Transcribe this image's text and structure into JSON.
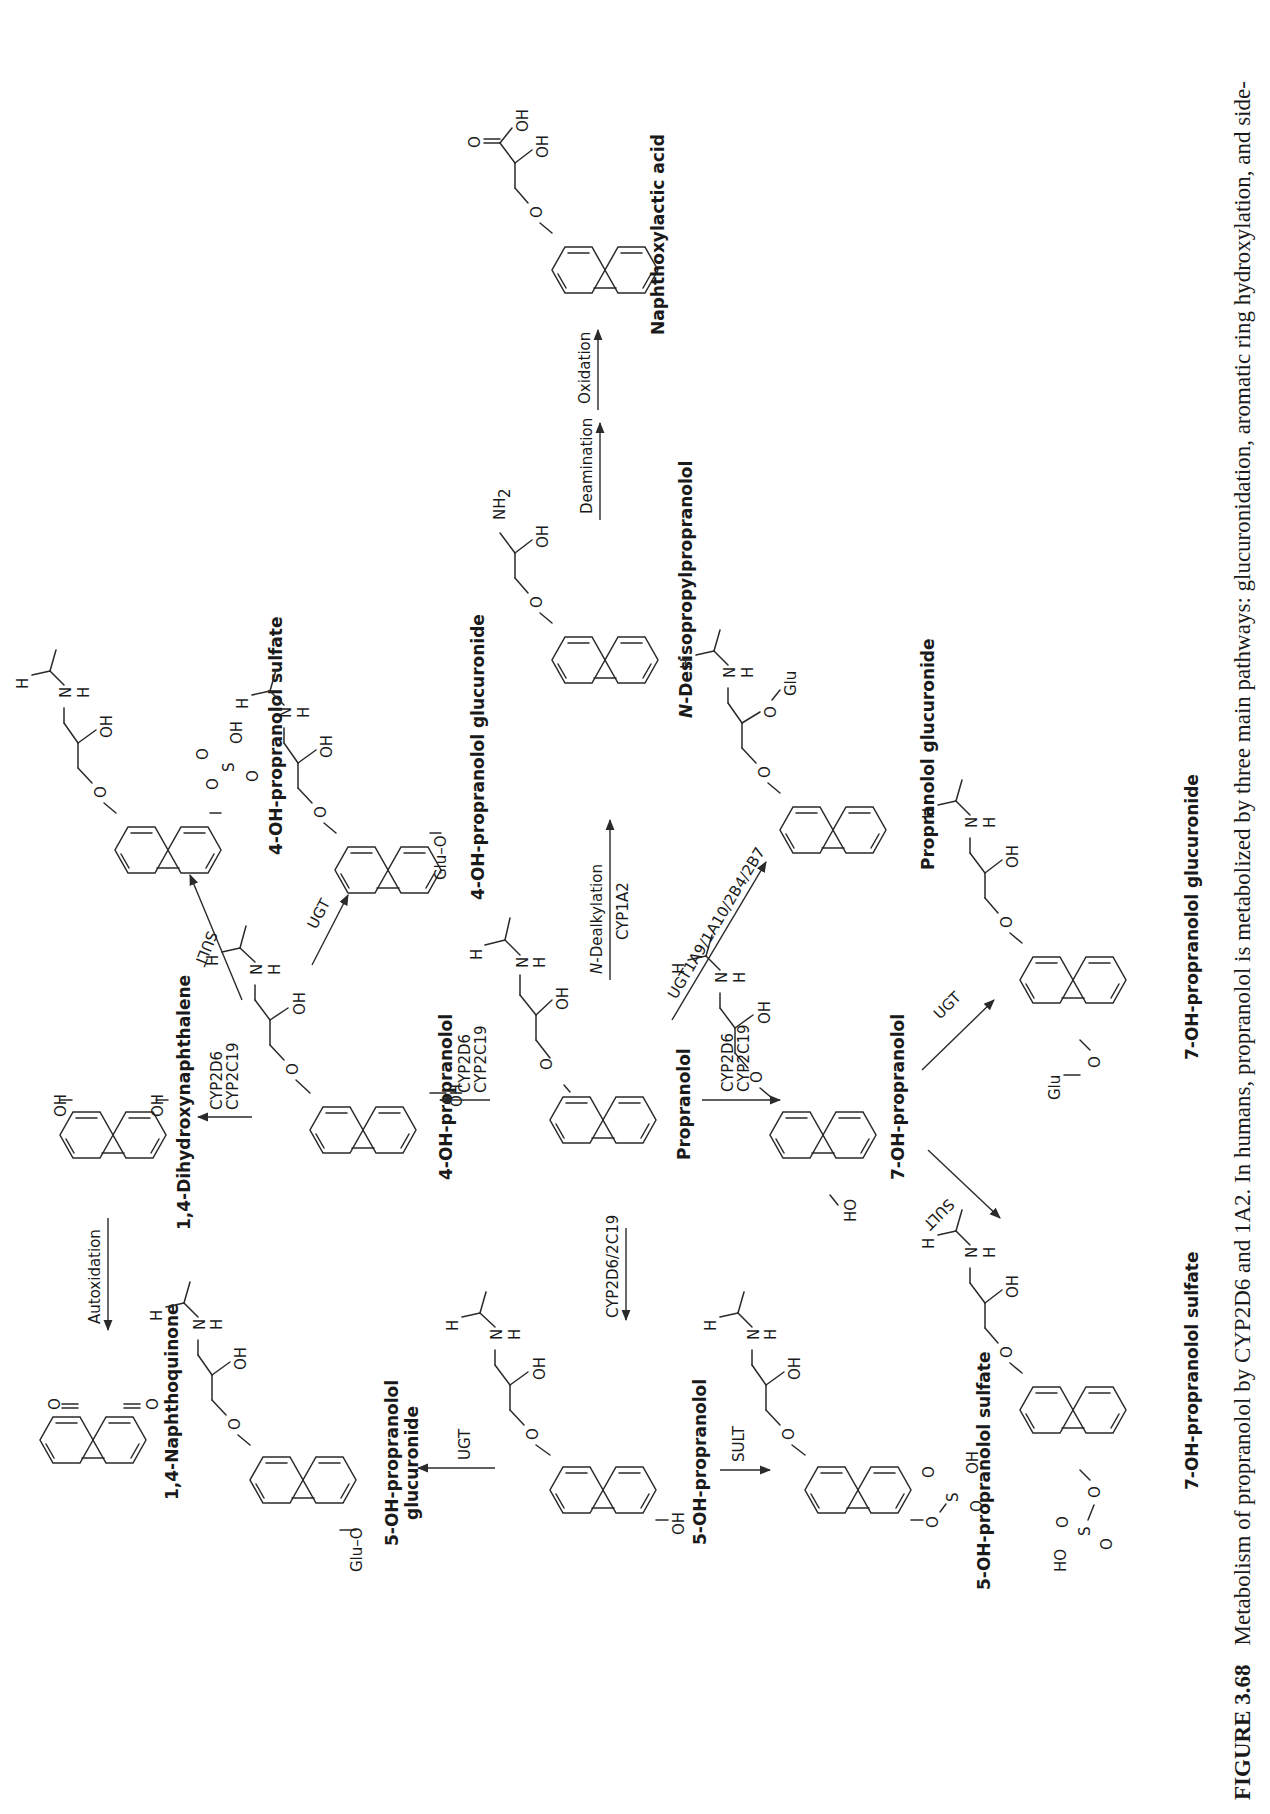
{
  "figure": {
    "number_label": "FIGURE 3.68",
    "caption": "Metabolism of propranolol by CYP2D6 and 1A2. In humans, propranolol is metabolized by three main pathways: glucuronidation, aromatic ring hydroxylation, and side-",
    "orientation": "rotated 90° counter-clockwise (landscape page)"
  },
  "compounds": {
    "propranolol": "Propranolol",
    "oh4": "4-OH-propranolol",
    "dihydroxy": "1,4-Dihydroxynaphthalene",
    "naphthoquinone": "1,4-Naphthoquinone",
    "oh5": "5-OH-propranolol",
    "oh5_gluc_line1": "5-OH-propranolol",
    "oh5_gluc_line2": "glucuronide",
    "oh5_sulf": "5-OH-propranolol sulfate",
    "oh7": "7-OH-propranolol",
    "oh7_sulf": "7-OH-propranolol sulfate",
    "oh7_gluc": "7-OH-propranolol glucuronide",
    "oh4_sulf": "4-OH-propranolol sulfate",
    "oh4_gluc": "4-OH-propranolol glucuronide",
    "desisopropyl_italic": "N",
    "desisopropyl": "-Desisopropylpropranolol",
    "prop_gluc": "Propranolol glucuronide",
    "naphthoxylactic": "Naphthoxylactic acid"
  },
  "reactions": {
    "to_4oh_line1": "CYP2D6",
    "to_4oh_line2": "CYP2C19",
    "to_dihydroxy_line1": "CYP2D6",
    "to_dihydroxy_line2": "CYP2C19",
    "autoxidation": "Autoxidation",
    "to_5oh": "CYP2D6/2C19",
    "to_5oh_gluc": "UGT",
    "to_5oh_sulf": "SULT",
    "to_7oh_line1": "CYP2D6",
    "to_7oh_line2": "CYP2C19",
    "to_7oh_sulf": "SULT",
    "to_7oh_gluc": "UGT",
    "to_4oh_sulf": "SULT",
    "to_4oh_gluc": "UGT",
    "dealkylation_italic": "N",
    "dealkylation": "-Dealkylation",
    "dealkylation_enzyme": "CYP1A2",
    "to_prop_gluc": "UGT1A9/1A10/2B4/2B7",
    "deamination": "Deamination",
    "oxidation": "Oxidation"
  },
  "atoms": {
    "O": "O",
    "OH": "OH",
    "HO": "HO",
    "N": "N",
    "H": "H",
    "NH2": "NH",
    "sub2": "2",
    "S": "S",
    "Glu": "Glu",
    "GluO": "Glu–O"
  }
}
